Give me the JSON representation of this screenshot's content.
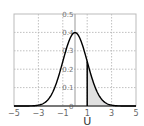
{
  "chart_data": {
    "type": "line",
    "title": "",
    "xlabel": "U",
    "ylabel": "",
    "xlim": [
      -5,
      5
    ],
    "ylim": [
      0,
      0.5
    ],
    "xticks": [
      -5,
      -3,
      -1,
      1,
      3,
      5
    ],
    "xtick_labels": [
      "−5",
      "−3",
      "−1",
      "1",
      "3",
      "5"
    ],
    "yticks": [
      0,
      0.1,
      0.2,
      0.3,
      0.4,
      0.5
    ],
    "ytick_labels": [
      "0",
      "0.1",
      "0.2",
      "0.3",
      "0.4",
      "0.5"
    ],
    "grid": true,
    "series": [
      {
        "name": "standard normal density",
        "function": "normal_pdf",
        "mean": 0,
        "sd": 1,
        "color": "#000000"
      }
    ],
    "shaded_region": {
      "from": 1,
      "to": 5,
      "fill": "#e0e0e0"
    },
    "marker_line_x": 1,
    "yaxis_at_x": 0
  }
}
